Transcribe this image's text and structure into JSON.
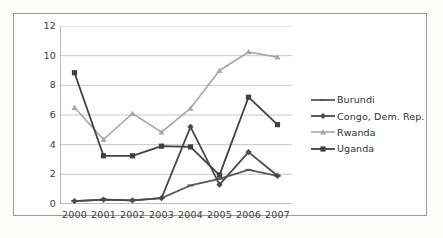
{
  "chart_data": {
    "type": "line",
    "title": "",
    "subtitle": "",
    "xlabel": "",
    "ylabel": "",
    "categories": [
      "2000",
      "2001",
      "2002",
      "2003",
      "2004",
      "2005",
      "2006",
      "2007"
    ],
    "x": [
      2000,
      2001,
      2002,
      2003,
      2004,
      2005,
      2006,
      2007
    ],
    "ylim": [
      0,
      12
    ],
    "yticks": [
      0,
      2,
      4,
      6,
      8,
      10,
      12
    ],
    "ytick_labels": [
      "0",
      "2",
      "4",
      "6",
      "8",
      "10",
      "12"
    ],
    "grid": "horizontal",
    "legend_position": "right",
    "series": [
      {
        "name": "Burundi",
        "color": "#595959",
        "marker": "dash",
        "values": [
          0.2,
          0.3,
          0.25,
          0.4,
          1.25,
          1.7,
          2.3,
          1.9
        ]
      },
      {
        "name": "Congo, Dem. Rep.",
        "color": "#4a4a4a",
        "marker": "diamond",
        "values": [
          0.2,
          0.3,
          0.25,
          0.4,
          5.2,
          1.3,
          3.5,
          1.9
        ]
      },
      {
        "name": "Rwanda",
        "color": "#a6a6a6",
        "marker": "triangle",
        "values": [
          6.5,
          4.35,
          6.1,
          4.85,
          6.45,
          9.0,
          10.25,
          9.9
        ]
      },
      {
        "name": "Uganda",
        "color": "#404040",
        "marker": "square",
        "values": [
          8.85,
          3.25,
          3.25,
          3.9,
          3.85,
          1.95,
          7.2,
          5.35
        ]
      }
    ]
  },
  "legend": {
    "items": [
      {
        "label": "Burundi"
      },
      {
        "label": "Congo, Dem. Rep."
      },
      {
        "label": "Rwanda"
      },
      {
        "label": "Uganda"
      }
    ]
  },
  "colors": {
    "axis": "#808080",
    "grid": "#c8c8c8",
    "frame": "#9b9b9b",
    "text": "#3a3a3a",
    "background": "#ffffff"
  }
}
